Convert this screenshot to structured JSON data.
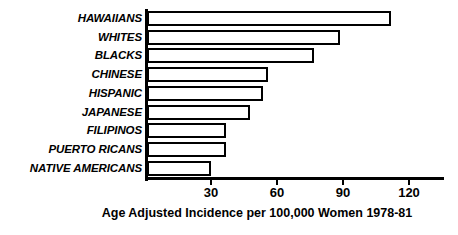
{
  "chart_data": {
    "type": "bar",
    "orientation": "horizontal",
    "title": "",
    "subtitle": "",
    "xlabel": "Age Adjusted Incidence per 100,000 Women 1978-81",
    "ylabel": "",
    "categories": [
      "HAWAIIANS",
      "WHITES",
      "BLACKS",
      "CHINESE",
      "HISPANIC",
      "JAPANESE",
      "FILIPINOS",
      "PUERTO RICANS",
      "NATIVE AMERICANS"
    ],
    "values": [
      110,
      87,
      75,
      54,
      52,
      46,
      35,
      35,
      28
    ],
    "xlim": [
      0,
      136
    ],
    "ylim": null,
    "xticks": [
      30,
      60,
      90,
      120
    ],
    "xtick_labels": [
      "30",
      "60",
      "90",
      "120"
    ],
    "grid": false,
    "legend": null,
    "legend_position": "none",
    "annotations": [],
    "colors": {
      "bar_fill": "#ffffff",
      "bar_stroke": "#000000",
      "axis": "#000000",
      "text": "#000000",
      "background": "#ffffff"
    }
  }
}
